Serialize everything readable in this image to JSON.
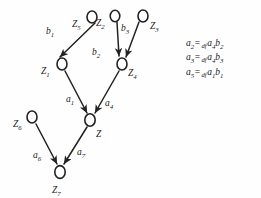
{
  "figure": {
    "background_color": "#fefefe",
    "ink_color": "#222222"
  },
  "graph": {
    "nodes": [
      {
        "id": "Z5",
        "base": "Z",
        "sub": "5",
        "cx": 92,
        "cy": 17,
        "label_x": 72,
        "label_y": 20
      },
      {
        "id": "Z2",
        "base": "Z",
        "sub": "2",
        "cx": 115,
        "cy": 16,
        "label_x": 96,
        "label_y": 19
      },
      {
        "id": "Z3",
        "base": "Z",
        "sub": "3",
        "cx": 143,
        "cy": 16,
        "label_x": 150,
        "label_y": 22
      },
      {
        "id": "Z1",
        "base": "Z",
        "sub": "1",
        "cx": 62,
        "cy": 64,
        "label_x": 41,
        "label_y": 67
      },
      {
        "id": "Z4",
        "base": "Z",
        "sub": "4",
        "cx": 122,
        "cy": 64,
        "label_x": 128,
        "label_y": 69
      },
      {
        "id": "Z",
        "base": "Z",
        "sub": "",
        "cx": 90,
        "cy": 120,
        "label_x": 96,
        "label_y": 130
      },
      {
        "id": "Z6",
        "base": "Z",
        "sub": "6",
        "cx": 32,
        "cy": 117,
        "label_x": 13,
        "label_y": 120
      },
      {
        "id": "Z7",
        "base": "Z",
        "sub": "7",
        "cx": 60,
        "cy": 172,
        "label_x": 52,
        "label_y": 186
      }
    ],
    "edges": [
      {
        "id": "b1",
        "base": "b",
        "sub": "1",
        "from": "Z5",
        "to": "Z1",
        "label_x": 46,
        "label_y": 27
      },
      {
        "id": "b2",
        "base": "b",
        "sub": "2",
        "from": "Z2",
        "to": "Z4",
        "label_x": 92,
        "label_y": 48
      },
      {
        "id": "b3",
        "base": "b",
        "sub": "3",
        "from": "Z3",
        "to": "Z4",
        "label_x": 121,
        "label_y": 24
      },
      {
        "id": "a1",
        "base": "a",
        "sub": "1",
        "from": "Z1",
        "to": "Z",
        "label_x": 66,
        "label_y": 95
      },
      {
        "id": "a4",
        "base": "a",
        "sub": "4",
        "from": "Z4",
        "to": "Z",
        "label_x": 105,
        "label_y": 99
      },
      {
        "id": "a6",
        "base": "a",
        "sub": "6",
        "from": "Z6",
        "to": "Z7",
        "label_x": 33,
        "label_y": 151
      },
      {
        "id": "a7",
        "base": "a",
        "sub": "7",
        "from": "Z",
        "to": "Z7",
        "label_x": 77,
        "label_y": 148
      }
    ]
  },
  "equations": [
    {
      "lhs_base": "a",
      "lhs_sub": "2",
      "eq": "=",
      "def": "df",
      "rhs": [
        {
          "base": "a",
          "sub": "4"
        },
        {
          "base": "b",
          "sub": "2"
        }
      ],
      "text": "a2 =df a4b2"
    },
    {
      "lhs_base": "a",
      "lhs_sub": "3",
      "eq": "=",
      "def": "df",
      "rhs": [
        {
          "base": "a",
          "sub": "4"
        },
        {
          "base": "b",
          "sub": "3"
        }
      ],
      "text": "a3 =df a4b3"
    },
    {
      "lhs_base": "a",
      "lhs_sub": "5",
      "eq": "=",
      "def": "df",
      "rhs": [
        {
          "base": "a",
          "sub": "1"
        },
        {
          "base": "b",
          "sub": "1"
        }
      ],
      "text": "a5 =df a1b1"
    }
  ]
}
